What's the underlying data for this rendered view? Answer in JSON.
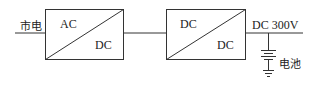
{
  "diagram": {
    "input_label": "市电",
    "converter1": {
      "top_label": "AC",
      "bottom_label": "DC"
    },
    "converter2": {
      "top_label": "DC",
      "bottom_label": "DC"
    },
    "output_label": "DC 300V",
    "battery_label": "电池"
  }
}
